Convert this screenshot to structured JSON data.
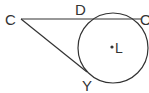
{
  "diagram": {
    "type": "geometry-circle-secant-tangent",
    "stroke_color": "#333333",
    "background": "#ffffff",
    "circle": {
      "center_label": "L",
      "cx": 113,
      "cy": 48,
      "r": 35
    },
    "points": {
      "C": {
        "label": "C",
        "x": 21,
        "y": 19
      },
      "D": {
        "label": "D",
        "x": 86,
        "y": 19
      },
      "O": {
        "label": "O",
        "x": 141,
        "y": 19
      },
      "Y": {
        "label": "Y",
        "x": 87,
        "y": 72
      },
      "L": {
        "label": "L",
        "x": 112,
        "y": 47
      }
    },
    "segments": [
      {
        "name": "secant-CO",
        "from": "C",
        "to": "O"
      },
      {
        "name": "tangent-CY",
        "from": "C",
        "to": "Y"
      }
    ]
  }
}
